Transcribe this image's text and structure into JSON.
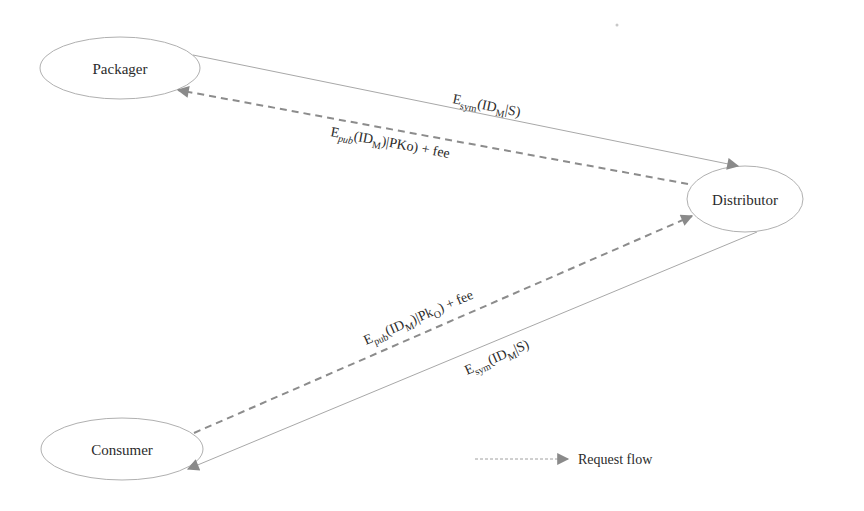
{
  "diagram": {
    "nodes": [
      {
        "id": "packager",
        "label": "Packager"
      },
      {
        "id": "distributor",
        "label": "Distributor"
      },
      {
        "id": "consumer",
        "label": "Consumer"
      }
    ],
    "edges": [
      {
        "id": "packager-to-distributor",
        "from": "Packager",
        "to": "Distributor",
        "style": "solid",
        "label": {
          "main": "E",
          "sub1": "sym",
          "mid": "(ID",
          "sub2": "M",
          "tail": "|S)"
        }
      },
      {
        "id": "distributor-to-packager",
        "from": "Distributor",
        "to": "Packager",
        "style": "dashed",
        "label": {
          "main": "E",
          "sub1": "pub",
          "mid": "(ID",
          "sub2": "M",
          "tail": ")|PKo) + fee"
        }
      },
      {
        "id": "consumer-to-distributor",
        "from": "Consumer",
        "to": "Distributor",
        "style": "dashed",
        "label": {
          "main": "E",
          "sub1": "pub",
          "mid": "(ID",
          "sub2": "M",
          "tail": ")|Pk",
          "sub3": "O",
          "tail2": ") + fee"
        }
      },
      {
        "id": "distributor-to-consumer",
        "from": "Distributor",
        "to": "Consumer",
        "style": "solid",
        "label": {
          "main": "E",
          "sub1": "sym",
          "mid": "(ID",
          "sub2": "M",
          "tail": "|S)"
        }
      }
    ],
    "legend": {
      "label": "Request flow",
      "style": "dashed-arrow"
    },
    "colors": {
      "stroke": "#a8a8a8",
      "dashed": "#8c8c8c",
      "arrow": "#8a8a8a",
      "text": "#2b2b2b"
    }
  }
}
